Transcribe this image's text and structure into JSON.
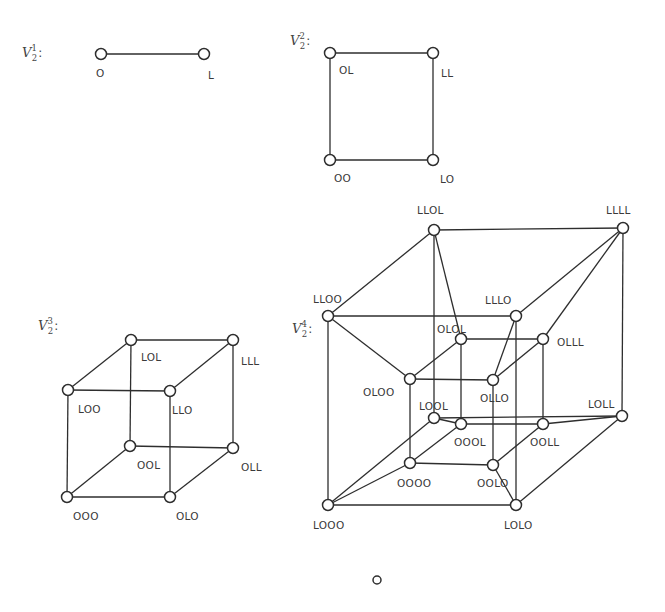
{
  "diagram": {
    "type": "hypercube-graphs",
    "colors": {
      "stroke": "#2e2e2e",
      "label": "#3a3a3a",
      "background": "#ffffff"
    },
    "graphs": [
      {
        "id": "v21",
        "title": {
          "base": "V",
          "sup": "1",
          "sub": "2",
          "colon": ":",
          "x": 22,
          "y": 57
        },
        "vertices": [
          {
            "label": "O",
            "x": 101,
            "y": 54,
            "lx": 96,
            "ly": 77
          },
          {
            "label": "L",
            "x": 204,
            "y": 54,
            "lx": 208,
            "ly": 79
          }
        ],
        "edges": [
          [
            "O",
            "L"
          ]
        ]
      },
      {
        "id": "v22",
        "title": {
          "base": "V",
          "sup": "2",
          "sub": "2",
          "colon": ":",
          "x": 290,
          "y": 45
        },
        "vertices": [
          {
            "label": "OL",
            "x": 330,
            "y": 53,
            "lx": 339,
            "ly": 74
          },
          {
            "label": "LL",
            "x": 433,
            "y": 53,
            "lx": 441,
            "ly": 77
          },
          {
            "label": "OO",
            "x": 330,
            "y": 160,
            "lx": 334,
            "ly": 182
          },
          {
            "label": "LO",
            "x": 433,
            "y": 160,
            "lx": 440,
            "ly": 183
          }
        ],
        "edges": [
          [
            "OL",
            "LL"
          ],
          [
            "OL",
            "OO"
          ],
          [
            "LL",
            "LO"
          ],
          [
            "OO",
            "LO"
          ]
        ]
      },
      {
        "id": "v23",
        "title": {
          "base": "V",
          "sup": "3",
          "sub": "2",
          "colon": ":",
          "x": 38,
          "y": 330
        },
        "vertices": [
          {
            "label": "LOL",
            "x": 131,
            "y": 340,
            "lx": 141,
            "ly": 361
          },
          {
            "label": "LLL",
            "x": 233,
            "y": 340,
            "lx": 241,
            "ly": 365
          },
          {
            "label": "LOO",
            "x": 68,
            "y": 390,
            "lx": 78,
            "ly": 413
          },
          {
            "label": "LLO",
            "x": 170,
            "y": 391,
            "lx": 172,
            "ly": 414
          },
          {
            "label": "OOL",
            "x": 130,
            "y": 446,
            "lx": 137,
            "ly": 469
          },
          {
            "label": "OLL",
            "x": 233,
            "y": 448,
            "lx": 241,
            "ly": 471
          },
          {
            "label": "OOO",
            "x": 67,
            "y": 497,
            "lx": 73,
            "ly": 520
          },
          {
            "label": "OLO",
            "x": 170,
            "y": 497,
            "lx": 176,
            "ly": 520
          }
        ],
        "edges": [
          [
            "LOL",
            "LLL"
          ],
          [
            "LOL",
            "LOO"
          ],
          [
            "LOL",
            "OOL"
          ],
          [
            "LLL",
            "LLO"
          ],
          [
            "LLL",
            "OLL"
          ],
          [
            "LOO",
            "LLO"
          ],
          [
            "LOO",
            "OOO"
          ],
          [
            "LLO",
            "OLO"
          ],
          [
            "OOL",
            "OLL"
          ],
          [
            "OOL",
            "OOO"
          ],
          [
            "OLL",
            "OLO"
          ],
          [
            "OOO",
            "OLO"
          ]
        ]
      },
      {
        "id": "v24",
        "title": {
          "base": "V",
          "sup": "4",
          "sub": "2",
          "colon": ":",
          "x": 292,
          "y": 333
        },
        "vertices": [
          {
            "label": "LLOL",
            "x": 434,
            "y": 230,
            "lx": 417,
            "ly": 214
          },
          {
            "label": "LLLL",
            "x": 623,
            "y": 228,
            "lx": 606,
            "ly": 214
          },
          {
            "label": "LLOO",
            "x": 328,
            "y": 316,
            "lx": 313,
            "ly": 303
          },
          {
            "label": "LLLO",
            "x": 516,
            "y": 316,
            "lx": 485,
            "ly": 304
          },
          {
            "label": "OLOL",
            "x": 461,
            "y": 339,
            "lx": 437,
            "ly": 333
          },
          {
            "label": "OLLL",
            "x": 543,
            "y": 339,
            "lx": 557,
            "ly": 346
          },
          {
            "label": "OLOO",
            "x": 410,
            "y": 379,
            "lx": 363,
            "ly": 396
          },
          {
            "label": "OLLO",
            "x": 493,
            "y": 380,
            "lx": 480,
            "ly": 402
          },
          {
            "label": "LOOL",
            "x": 434,
            "y": 418,
            "lx": 419,
            "ly": 410
          },
          {
            "label": "OOOL",
            "x": 461,
            "y": 424,
            "lx": 454,
            "ly": 446
          },
          {
            "label": "OOLL",
            "x": 543,
            "y": 424,
            "lx": 530,
            "ly": 446
          },
          {
            "label": "LOLL",
            "x": 622,
            "y": 416,
            "lx": 588,
            "ly": 408
          },
          {
            "label": "OOOO",
            "x": 410,
            "y": 463,
            "lx": 397,
            "ly": 487
          },
          {
            "label": "OOLO",
            "x": 493,
            "y": 465,
            "lx": 477,
            "ly": 487
          },
          {
            "label": "LOOO",
            "x": 328,
            "y": 505,
            "lx": 313,
            "ly": 529
          },
          {
            "label": "LOLO",
            "x": 516,
            "y": 505,
            "lx": 504,
            "ly": 529
          }
        ],
        "edges": [
          [
            "LLOL",
            "LLLL"
          ],
          [
            "LLOL",
            "LLOO"
          ],
          [
            "LLOL",
            "OLOL"
          ],
          [
            "LLOL",
            "LOOL"
          ],
          [
            "LLLL",
            "LLLO"
          ],
          [
            "LLLL",
            "OLLL"
          ],
          [
            "LLLL",
            "LOLL"
          ],
          [
            "LLOO",
            "LLLO"
          ],
          [
            "LLOO",
            "OLOO"
          ],
          [
            "LLOO",
            "LOOO"
          ],
          [
            "LLLO",
            "OLLO"
          ],
          [
            "LLLO",
            "LOLO"
          ],
          [
            "OLOL",
            "OLLL"
          ],
          [
            "OLOL",
            "OLOO"
          ],
          [
            "OLOL",
            "OOOL"
          ],
          [
            "OLLL",
            "OLLO"
          ],
          [
            "OLLL",
            "OOLL"
          ],
          [
            "OLOO",
            "OLLO"
          ],
          [
            "OLOO",
            "OOOO"
          ],
          [
            "OLLO",
            "OOLO"
          ],
          [
            "LOOL",
            "LOLL"
          ],
          [
            "LOOL",
            "OOOL"
          ],
          [
            "LOOL",
            "LOOO"
          ],
          [
            "OOOL",
            "OOLL"
          ],
          [
            "OOOL",
            "OOOO"
          ],
          [
            "OOLL",
            "LOLL"
          ],
          [
            "OOLL",
            "OOLO"
          ],
          [
            "LOLL",
            "LOLO"
          ],
          [
            "OOOO",
            "OOLO"
          ],
          [
            "OOOO",
            "LOOO"
          ],
          [
            "OOLO",
            "LOLO"
          ],
          [
            "LOOO",
            "LOLO"
          ]
        ]
      }
    ],
    "footer_marker": {
      "symbol": "○",
      "x": 377,
      "y": 580
    }
  }
}
